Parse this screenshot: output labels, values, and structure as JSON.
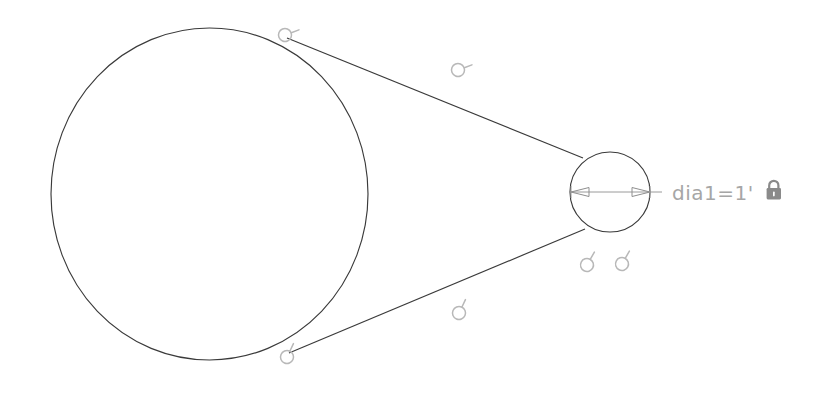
{
  "app": {
    "surface": "cad-sketch-canvas",
    "background_color": "#ffffff"
  },
  "colors": {
    "geometry_stroke": "#3a3a3a",
    "dimension_stroke": "#9a9a9a",
    "dimension_text": "#a6a6a6",
    "constraint_glyph": "#b8b8b8",
    "lock_icon": "#8a8a8a"
  },
  "sketch": {
    "entities": [
      {
        "name": "large-circle",
        "type": "circle",
        "cx": 209.5,
        "cy": 194,
        "rx": 158.5,
        "ry": 166
      },
      {
        "name": "small-circle",
        "type": "circle",
        "cx": 610,
        "cy": 192,
        "rx": 40,
        "ry": 40
      },
      {
        "name": "upper-tangent-line",
        "type": "line",
        "x1": 287,
        "y1": 38,
        "x2": 583,
        "y2": 158
      },
      {
        "name": "lower-tangent-line",
        "type": "line",
        "x1": 289,
        "y1": 353,
        "x2": 585,
        "y2": 229
      }
    ],
    "constraints": [
      {
        "name": "tangent-glyph-upper-left",
        "label": "tangent",
        "x": 285,
        "y": 35
      },
      {
        "name": "tangent-glyph-upper-mid",
        "label": "tangent",
        "x": 458,
        "y": 70
      },
      {
        "name": "tangent-glyph-lower-left",
        "label": "tangent",
        "x": 287,
        "y": 357
      },
      {
        "name": "tangent-glyph-lower-mid",
        "label": "tangent",
        "x": 459,
        "y": 313
      },
      {
        "name": "tangent-glyph-pair-left",
        "label": "tangent",
        "x": 587,
        "y": 265
      },
      {
        "name": "tangent-glyph-pair-right",
        "label": "tangent",
        "x": 622,
        "y": 264
      }
    ]
  },
  "dimension": {
    "name": "diameter-dimension",
    "label": "dia1=1'",
    "variable": "dia1",
    "operator": "=",
    "value": "1'",
    "locked": true,
    "lock_icon": "padlock-icon",
    "text_x": 672,
    "text_y": 200,
    "leader": {
      "x1": 571,
      "y1": 192,
      "x2": 662,
      "y2": 192
    }
  }
}
